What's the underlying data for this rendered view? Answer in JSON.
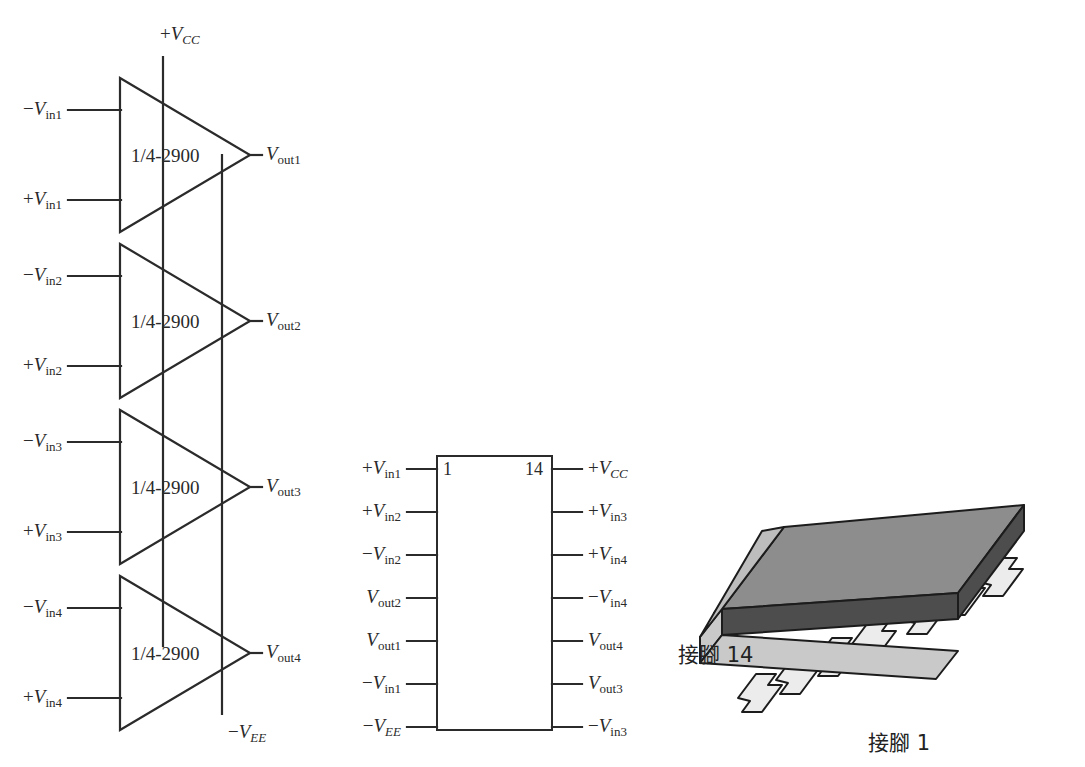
{
  "figure": {
    "type": "schematic-diagram"
  },
  "amplifier_block": {
    "supply_top": {
      "label_sign": "+",
      "label_v": "V",
      "label_sub": "CC"
    },
    "supply_bottom": {
      "label_sign": "−",
      "label_v": "V",
      "label_sub": "EE"
    },
    "amps": [
      {
        "body_label": "1/4-2900",
        "inv_in": {
          "sign": "−",
          "v": "V",
          "sub": "in1"
        },
        "non_inv_in": {
          "sign": "+",
          "v": "V",
          "sub": "in1"
        },
        "out": {
          "sign": "",
          "v": "V",
          "sub": "out1"
        }
      },
      {
        "body_label": "1/4-2900",
        "inv_in": {
          "sign": "−",
          "v": "V",
          "sub": "in2"
        },
        "non_inv_in": {
          "sign": "+",
          "v": "V",
          "sub": "in2"
        },
        "out": {
          "sign": "",
          "v": "V",
          "sub": "out2"
        }
      },
      {
        "body_label": "1/4-2900",
        "inv_in": {
          "sign": "−",
          "v": "V",
          "sub": "in3"
        },
        "non_inv_in": {
          "sign": "+",
          "v": "V",
          "sub": "in3"
        },
        "out": {
          "sign": "",
          "v": "V",
          "sub": "out3"
        }
      },
      {
        "body_label": "1/4-2900",
        "inv_in": {
          "sign": "−",
          "v": "V",
          "sub": "in4"
        },
        "non_inv_in": {
          "sign": "+",
          "v": "V",
          "sub": "in4"
        },
        "out": {
          "sign": "",
          "v": "V",
          "sub": "out4"
        }
      }
    ]
  },
  "pinout": {
    "first_pin_number": "1",
    "last_pin_number": "14",
    "left_pins": [
      {
        "sign": "+",
        "v": "V",
        "sub": "in1"
      },
      {
        "sign": "+",
        "v": "V",
        "sub": "in2"
      },
      {
        "sign": "−",
        "v": "V",
        "sub": "in2"
      },
      {
        "sign": "",
        "v": "V",
        "sub": "out2"
      },
      {
        "sign": "",
        "v": "V",
        "sub": "out1"
      },
      {
        "sign": "−",
        "v": "V",
        "sub": "in1"
      },
      {
        "sign": "−",
        "v": "V",
        "sub": "EE",
        "sub_italic": true
      }
    ],
    "right_pins": [
      {
        "sign": "+",
        "v": "V",
        "sub": "CC",
        "sub_italic": true
      },
      {
        "sign": "+",
        "v": "V",
        "sub": "in3"
      },
      {
        "sign": "+",
        "v": "V",
        "sub": "in4"
      },
      {
        "sign": "−",
        "v": "V",
        "sub": "in4"
      },
      {
        "sign": "",
        "v": "V",
        "sub": "out4"
      },
      {
        "sign": "",
        "v": "V",
        "sub": "out3"
      },
      {
        "sign": "−",
        "v": "V",
        "sub": "in3"
      }
    ]
  },
  "package": {
    "label_pin14": "接腳 14",
    "label_pin1": "接腳 1",
    "colors": {
      "top_face": "#8d8d8d",
      "front_bevel": "#4d4d4d",
      "side_face": "#c9c9c9",
      "lead": "#e8e8e8",
      "outline": "#1c1c1c"
    }
  },
  "style": {
    "line_color": "#2b2b2b",
    "background": "#ffffff"
  }
}
